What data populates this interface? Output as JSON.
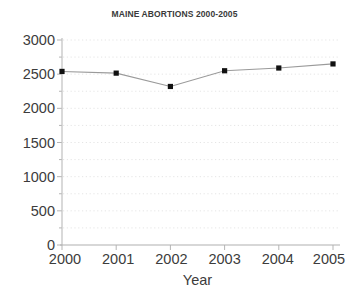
{
  "chart_data": {
    "type": "line",
    "title": "MAINE ABORTIONS 2000-2005",
    "xlabel": "Year",
    "ylabel": "",
    "categories": [
      "2000",
      "2001",
      "2002",
      "2003",
      "2004",
      "2005"
    ],
    "x": [
      2000,
      2001,
      2002,
      2003,
      2004,
      2005
    ],
    "values": [
      2540,
      2515,
      2320,
      2550,
      2590,
      2650
    ],
    "series": [
      {
        "name": "Maine abortions",
        "values": [
          2540,
          2515,
          2320,
          2550,
          2590,
          2650
        ]
      }
    ],
    "ylim": [
      0,
      3000
    ],
    "xlim": [
      2000,
      2005
    ],
    "yticks": [
      0,
      500,
      1000,
      1500,
      2000,
      2500,
      3000
    ],
    "ytick_labels": [
      "0",
      "500",
      "1000",
      "1500",
      "2000",
      "2500",
      "3000"
    ],
    "xtick_labels": [
      "2000",
      "2001",
      "2002",
      "2003",
      "2004",
      "2005"
    ],
    "grid": "horizontal-dotted",
    "legend": "none",
    "marker": "square",
    "marker_color": "#111111",
    "line_color": "#9a9a9a",
    "grid_color": "#e2e2e2",
    "axis_color": "#b8b8b8",
    "background": "#ffffff"
  }
}
